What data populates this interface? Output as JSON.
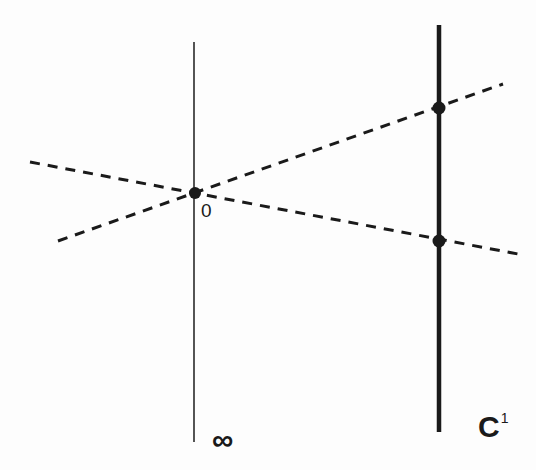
{
  "diagram": {
    "labels": {
      "origin": "0",
      "infinity": "∞",
      "line_base": "C",
      "line_superscript": "1"
    },
    "colors": {
      "ink": "#1a1a1a",
      "background": "#fdfdfd"
    },
    "lines": [
      {
        "id": "infinity-line",
        "style": "thin-solid",
        "x1": 194,
        "y1": 42,
        "x2": 194,
        "y2": 442
      },
      {
        "id": "c1-line",
        "style": "thick-solid",
        "x1": 439,
        "y1": 25,
        "x2": 439,
        "y2": 432
      },
      {
        "id": "dashed-line-upper",
        "style": "dashed",
        "x1": 58,
        "y1": 241,
        "x2": 503,
        "y2": 84
      },
      {
        "id": "dashed-line-lower",
        "style": "dashed",
        "x1": 30,
        "y1": 162,
        "x2": 518,
        "y2": 254
      }
    ],
    "points": [
      {
        "id": "origin-point",
        "x": 195,
        "y": 193
      },
      {
        "id": "upper-intersection",
        "x": 439,
        "y": 108
      },
      {
        "id": "lower-intersection",
        "x": 439,
        "y": 241
      }
    ]
  }
}
